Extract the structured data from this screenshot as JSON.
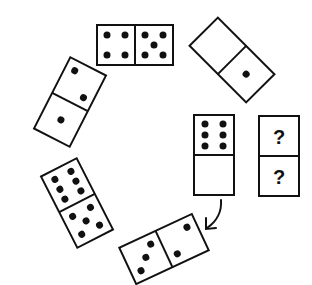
{
  "colors": {
    "background": "#ffffff",
    "ink": "#111111"
  },
  "dominoes": [
    {
      "id": "domino-top",
      "halves": [
        4,
        5
      ],
      "orientation": "horizontal",
      "center": [
        135,
        45
      ],
      "rotation": 0
    },
    {
      "id": "domino-upper-right",
      "halves": [
        0,
        1
      ],
      "orientation": "tilted",
      "center": [
        232,
        60
      ],
      "rotation": 45
    },
    {
      "id": "domino-upper-left",
      "halves": [
        2,
        1
      ],
      "orientation": "tilted",
      "center": [
        70,
        102
      ],
      "rotation": 27
    },
    {
      "id": "domino-lower-left",
      "halves": [
        6,
        5
      ],
      "orientation": "tilted",
      "center": [
        77,
        203
      ],
      "rotation": -27
    },
    {
      "id": "domino-bottom",
      "halves": [
        3,
        2
      ],
      "orientation": "tilted",
      "center": [
        164,
        249
      ],
      "rotation": -25
    },
    {
      "id": "domino-middle",
      "halves": [
        6,
        0
      ],
      "orientation": "vertical",
      "center": [
        214,
        155
      ],
      "rotation": 0
    }
  ],
  "answer_domino": {
    "halves": [
      "?",
      "?"
    ],
    "center": [
      279,
      156
    ]
  },
  "arrow": {
    "from": "domino-middle",
    "to": "domino-bottom",
    "icon": "curved-arrow-icon"
  }
}
